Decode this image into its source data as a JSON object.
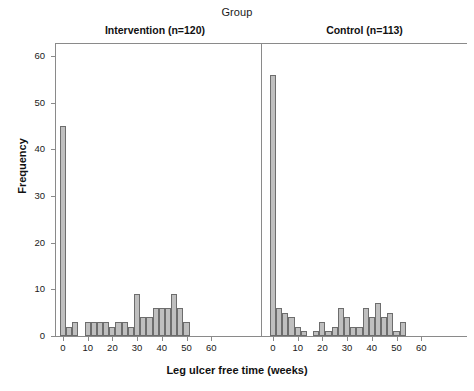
{
  "chart_data": {
    "type": "bar",
    "title": "Group",
    "xlabel": "Leg ulcer free time (weeks)",
    "ylabel": "Frequency",
    "xlim": [
      -4,
      64
    ],
    "ylim": [
      0,
      63
    ],
    "xticks": [
      0,
      10,
      20,
      30,
      40,
      50,
      60
    ],
    "xtick_labels": [
      "0",
      "10",
      "20",
      "30",
      "40",
      "50",
      "60"
    ],
    "yticks": [
      0,
      10,
      20,
      30,
      40,
      50,
      60
    ],
    "ytick_labels": [
      "0",
      "10",
      "20",
      "30",
      "40",
      "50",
      "60"
    ],
    "grid": false,
    "legend": "none",
    "bin_width": 2.5,
    "bar_fill": "#bfbfbf",
    "bar_edge": "#6d6d6d",
    "panels": [
      {
        "name": "intervention",
        "label": "Intervention (n=120)",
        "bins": [
          {
            "x": 0,
            "value": 45
          },
          {
            "x": 2.5,
            "value": 2
          },
          {
            "x": 5,
            "value": 3
          },
          {
            "x": 7.5,
            "value": 0
          },
          {
            "x": 10,
            "value": 3
          },
          {
            "x": 12.5,
            "value": 3
          },
          {
            "x": 15,
            "value": 3
          },
          {
            "x": 17.5,
            "value": 3
          },
          {
            "x": 20,
            "value": 2
          },
          {
            "x": 22.5,
            "value": 3
          },
          {
            "x": 25,
            "value": 3
          },
          {
            "x": 27.5,
            "value": 2
          },
          {
            "x": 30,
            "value": 9
          },
          {
            "x": 32.5,
            "value": 4
          },
          {
            "x": 35,
            "value": 4
          },
          {
            "x": 37.5,
            "value": 6
          },
          {
            "x": 40,
            "value": 6
          },
          {
            "x": 42.5,
            "value": 6
          },
          {
            "x": 45,
            "value": 9
          },
          {
            "x": 47.5,
            "value": 6
          },
          {
            "x": 50,
            "value": 3
          },
          {
            "x": 52.5,
            "value": 0
          }
        ]
      },
      {
        "name": "control",
        "label": "Control (n=113)",
        "bins": [
          {
            "x": 0,
            "value": 56
          },
          {
            "x": 2.5,
            "value": 6
          },
          {
            "x": 5,
            "value": 5
          },
          {
            "x": 7.5,
            "value": 4
          },
          {
            "x": 10,
            "value": 2
          },
          {
            "x": 12.5,
            "value": 1
          },
          {
            "x": 15,
            "value": 0
          },
          {
            "x": 17.5,
            "value": 1
          },
          {
            "x": 20,
            "value": 3
          },
          {
            "x": 22.5,
            "value": 1
          },
          {
            "x": 25,
            "value": 2
          },
          {
            "x": 27.5,
            "value": 6
          },
          {
            "x": 30,
            "value": 4
          },
          {
            "x": 32.5,
            "value": 2
          },
          {
            "x": 35,
            "value": 2
          },
          {
            "x": 37.5,
            "value": 6
          },
          {
            "x": 40,
            "value": 4
          },
          {
            "x": 42.5,
            "value": 7
          },
          {
            "x": 45,
            "value": 4
          },
          {
            "x": 47.5,
            "value": 5
          },
          {
            "x": 50,
            "value": 1
          },
          {
            "x": 52.5,
            "value": 3
          }
        ]
      }
    ]
  }
}
